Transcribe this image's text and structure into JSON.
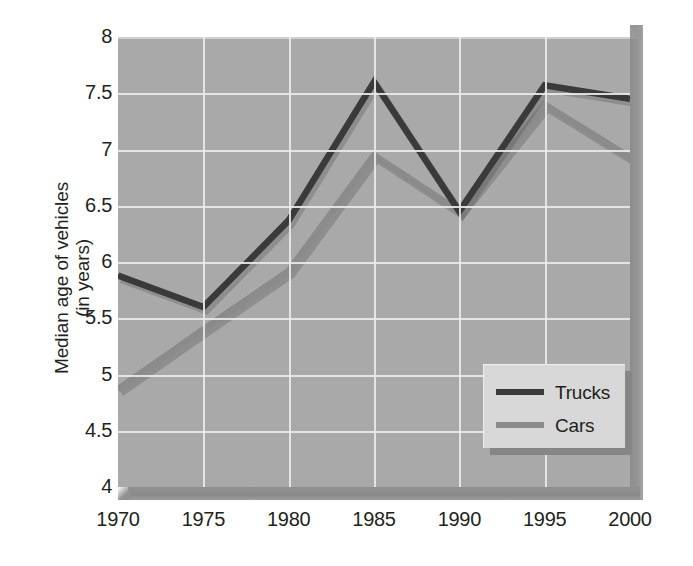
{
  "chart_data": {
    "type": "line",
    "title": "",
    "subtitle": "",
    "xlabel": "",
    "ylabel": "Median age of vehicles (in years)",
    "ylabel_line1": "Median age of vehicles",
    "ylabel_line2": "(in years)",
    "x": [
      1970,
      1975,
      1980,
      1985,
      1990,
      1995,
      2000
    ],
    "categories": [
      "1970",
      "1975",
      "1980",
      "1985",
      "1990",
      "1995",
      "2000"
    ],
    "xlim": [
      1970,
      2000
    ],
    "ylim": [
      4,
      8
    ],
    "yticks": [
      8,
      7.5,
      7,
      6.5,
      6,
      5.5,
      5,
      4.5,
      4
    ],
    "ytick_labels": [
      "8",
      "7.5",
      "7",
      "6.5",
      "6",
      "5.5",
      "5",
      "4.5",
      "4"
    ],
    "xticks": [
      1970,
      1975,
      1980,
      1985,
      1990,
      1995,
      2000
    ],
    "xtick_labels": [
      "1970",
      "1975",
      "1980",
      "1985",
      "1990",
      "1995",
      "2000"
    ],
    "grid": true,
    "grid_color": "#e9e9e9",
    "plot_background": "#a9a9a9",
    "legend_position": "bottom-right",
    "series": [
      {
        "name": "Trucks",
        "color": "#3a3a3a",
        "values": [
          5.88,
          5.6,
          6.37,
          7.6,
          6.45,
          7.57,
          7.45
        ]
      },
      {
        "name": "Cars",
        "color": "#8b8b8b",
        "values": [
          4.87,
          5.4,
          5.92,
          6.95,
          6.45,
          7.4,
          6.93
        ]
      }
    ]
  },
  "legend": {
    "items": [
      {
        "label": "Trucks",
        "color": "#3a3a3a"
      },
      {
        "label": "Cars",
        "color": "#8b8b8b"
      }
    ]
  },
  "colors": {
    "plot_background": "#a9a9a9",
    "gridline": "#e9e9e9",
    "trucks": "#3a3a3a",
    "cars": "#8b8b8b",
    "legend_background": "#d8d8d8",
    "legend_shadow": "#868686",
    "text": "#231f20",
    "page_background": "#ffffff"
  }
}
